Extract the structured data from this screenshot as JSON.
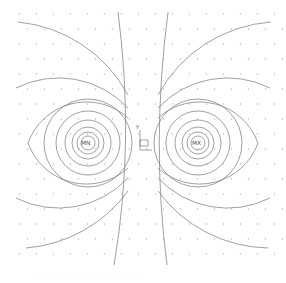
{
  "diagram": {
    "type": "magnetic field lines of two poles",
    "poles": [
      {
        "label": "MN",
        "x": 88,
        "y": 143
      },
      {
        "label": "MX",
        "x": 198,
        "y": 143
      }
    ],
    "axis_marker": {
      "y_label": "Y",
      "x": 143,
      "y": 143
    },
    "caption": "· · · · · · · · · · · · · · · · · · · · · · · ·",
    "colors": {
      "line": "#777777",
      "dot": "#b8b8b8",
      "background": "#ffffff"
    }
  }
}
